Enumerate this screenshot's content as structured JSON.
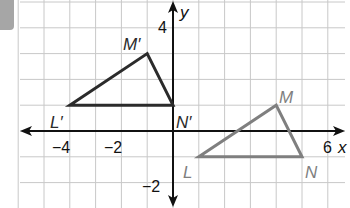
{
  "diagram": {
    "type": "coordinate-plane-transformation",
    "axes": {
      "x_label": "x",
      "y_label": "y",
      "x_ticks": [
        {
          "value": -4,
          "label": "−4"
        },
        {
          "value": -2,
          "label": "−2"
        },
        {
          "value": 6,
          "label": "6"
        }
      ],
      "y_ticks": [
        {
          "value": 4,
          "label": "4"
        },
        {
          "value": -2,
          "label": "−2"
        }
      ]
    },
    "grid": {
      "x_range": [
        -6,
        6
      ],
      "y_range": [
        -3,
        5
      ],
      "spacing": 1
    },
    "triangles": [
      {
        "name": "image",
        "color": "#2b2b2b",
        "vertices": [
          {
            "label": "L′",
            "x": -4,
            "y": 1
          },
          {
            "label": "M′",
            "x": -1,
            "y": 3
          },
          {
            "label": "N′",
            "x": 0,
            "y": 1
          }
        ]
      },
      {
        "name": "preimage",
        "color": "#7f7f7f",
        "vertices": [
          {
            "label": "L",
            "x": 1,
            "y": -1
          },
          {
            "label": "M",
            "x": 4,
            "y": 1
          },
          {
            "label": "N",
            "x": 5,
            "y": -1
          }
        ]
      }
    ]
  }
}
